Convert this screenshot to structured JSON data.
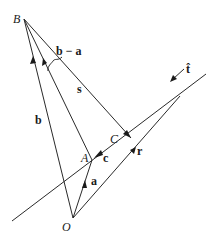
{
  "figure": {
    "type": "vector-geometry-diagram",
    "points": {
      "B": {
        "label": "B",
        "x": 24,
        "y": 19
      },
      "O": {
        "label": "O",
        "x": 73,
        "y": 218
      },
      "A": {
        "label": "A",
        "x": 92,
        "y": 160
      },
      "C": {
        "label": "C",
        "x": 131,
        "y": 138
      }
    },
    "vectors": {
      "b": {
        "label": "b"
      },
      "a": {
        "label": "a"
      },
      "b_minus_a": {
        "label": "b − a"
      },
      "s": {
        "label": "s"
      },
      "c": {
        "label": "c"
      },
      "r": {
        "label": "r"
      },
      "t_hat": {
        "label": "t̂"
      }
    }
  }
}
